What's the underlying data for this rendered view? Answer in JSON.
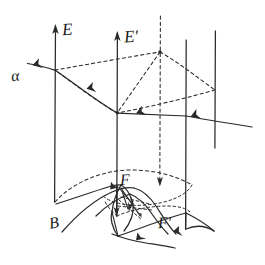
{
  "figure": {
    "kind": "hand-drawn-physics-diagram",
    "title_visible": false,
    "background_color": "#ffffff",
    "ink_color": "#2a2a2a",
    "canvas": {
      "width": 265,
      "height": 265
    }
  },
  "labels": {
    "field_E": "E",
    "field_E_prime": "Eʹ",
    "particle_alpha": "α",
    "field_B": "B",
    "surface_F": "F",
    "surface_F_prime": "Fʹ"
  },
  "elements": {
    "vertical_field_lines": [
      {
        "name": "E-line",
        "x": 55,
        "y_top": 24,
        "y_bottom": 202,
        "arrow": "up",
        "label": "E"
      },
      {
        "name": "E-prime-line",
        "x": 117,
        "y_top": 31,
        "y_bottom": 216,
        "arrow": "up",
        "label": "Eʹ"
      },
      {
        "name": "back-right-line",
        "x": 186,
        "y_top": 40,
        "y_bottom": 229,
        "arrow": "none",
        "label": ""
      },
      {
        "name": "far-right-line",
        "x": 215,
        "y_top": 31,
        "y_bottom": 148,
        "arrow": "none",
        "label": ""
      }
    ],
    "dashed_axis": {
      "name": "vertical-dashed-axis",
      "x": 160,
      "y_top": 16,
      "y_bottom": 184
    },
    "alpha_track": {
      "description": "alpha particle path leaving upper-left",
      "arrow_direction": "up-left",
      "from": [
        117,
        113
      ],
      "to": [
        28,
        68
      ]
    },
    "incoming_ray": {
      "description": "incoming ray entering from lower right toward E-prime line",
      "arrow_direction": "left",
      "from": [
        252,
        127
      ],
      "to": [
        117,
        113
      ]
    },
    "dashed_parallelogram": {
      "vertices": [
        [
          55,
          70
        ],
        [
          160,
          52
        ],
        [
          215,
          90
        ],
        [
          117,
          113
        ]
      ]
    },
    "bottom_dashed_ellipse_arcs": 2,
    "bottom_surfaces": [
      "F",
      "Fʹ"
    ],
    "arrow_count": 11
  }
}
